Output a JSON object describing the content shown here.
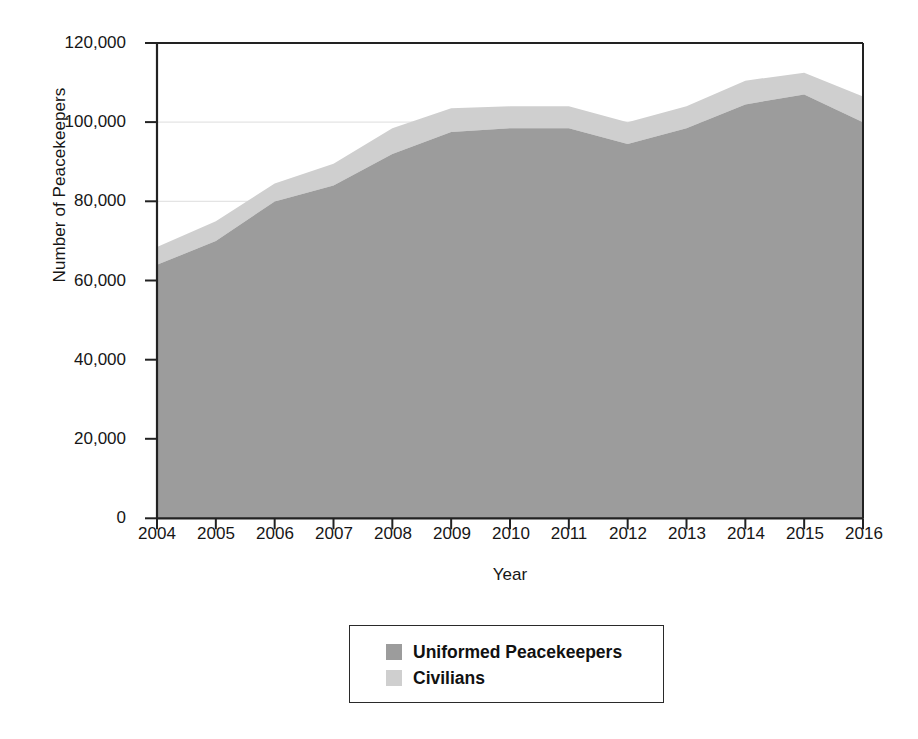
{
  "chart_data": {
    "type": "area",
    "stacked": true,
    "title": "",
    "xlabel": "Year",
    "ylabel": "Number of Peacekeepers",
    "categories": [
      "2004",
      "2005",
      "2006",
      "2007",
      "2008",
      "2009",
      "2010",
      "2011",
      "2012",
      "2013",
      "2014",
      "2015",
      "2016"
    ],
    "x": [
      2004,
      2005,
      2006,
      2007,
      2008,
      2009,
      2010,
      2011,
      2012,
      2013,
      2014,
      2015,
      2016
    ],
    "series": [
      {
        "name": "Uniformed Peacekeepers",
        "color": "#9c9c9c",
        "values": [
          64000,
          70000,
          80000,
          84000,
          92000,
          97500,
          98500,
          98500,
          94500,
          98500,
          104500,
          107000,
          100000
        ]
      },
      {
        "name": "Civilians",
        "color": "#cfcfcf",
        "values": [
          4500,
          5000,
          4500,
          5500,
          6500,
          6000,
          5500,
          5500,
          5500,
          5500,
          6000,
          5500,
          6500
        ]
      }
    ],
    "totals": [
      68500,
      75000,
      84500,
      89500,
      98500,
      103500,
      104000,
      104000,
      100000,
      104000,
      110500,
      112500,
      106500
    ],
    "xlim": [
      2004,
      2016
    ],
    "ylim": [
      0,
      120000
    ],
    "ytick_labels": [
      "120,000",
      "100,000",
      "80,000",
      "60,000",
      "40,000",
      "20,000",
      "0"
    ],
    "ytick_values": [
      120000,
      100000,
      80000,
      60000,
      40000,
      20000,
      0
    ],
    "grid": "horizontal",
    "legend_position": "below-center",
    "legend": [
      {
        "label": "Uniformed Peacekeepers",
        "color": "#9c9c9c"
      },
      {
        "label": "Civilians",
        "color": "#cfcfcf"
      }
    ]
  },
  "axes": {
    "y_title": "Number of Peacekeepers",
    "x_title": "Year"
  },
  "colors": {
    "uniformed": "#9c9c9c",
    "civilians": "#cfcfcf",
    "axis": "#222222",
    "gridline": "#e6e6e6",
    "background": "#ffffff"
  }
}
